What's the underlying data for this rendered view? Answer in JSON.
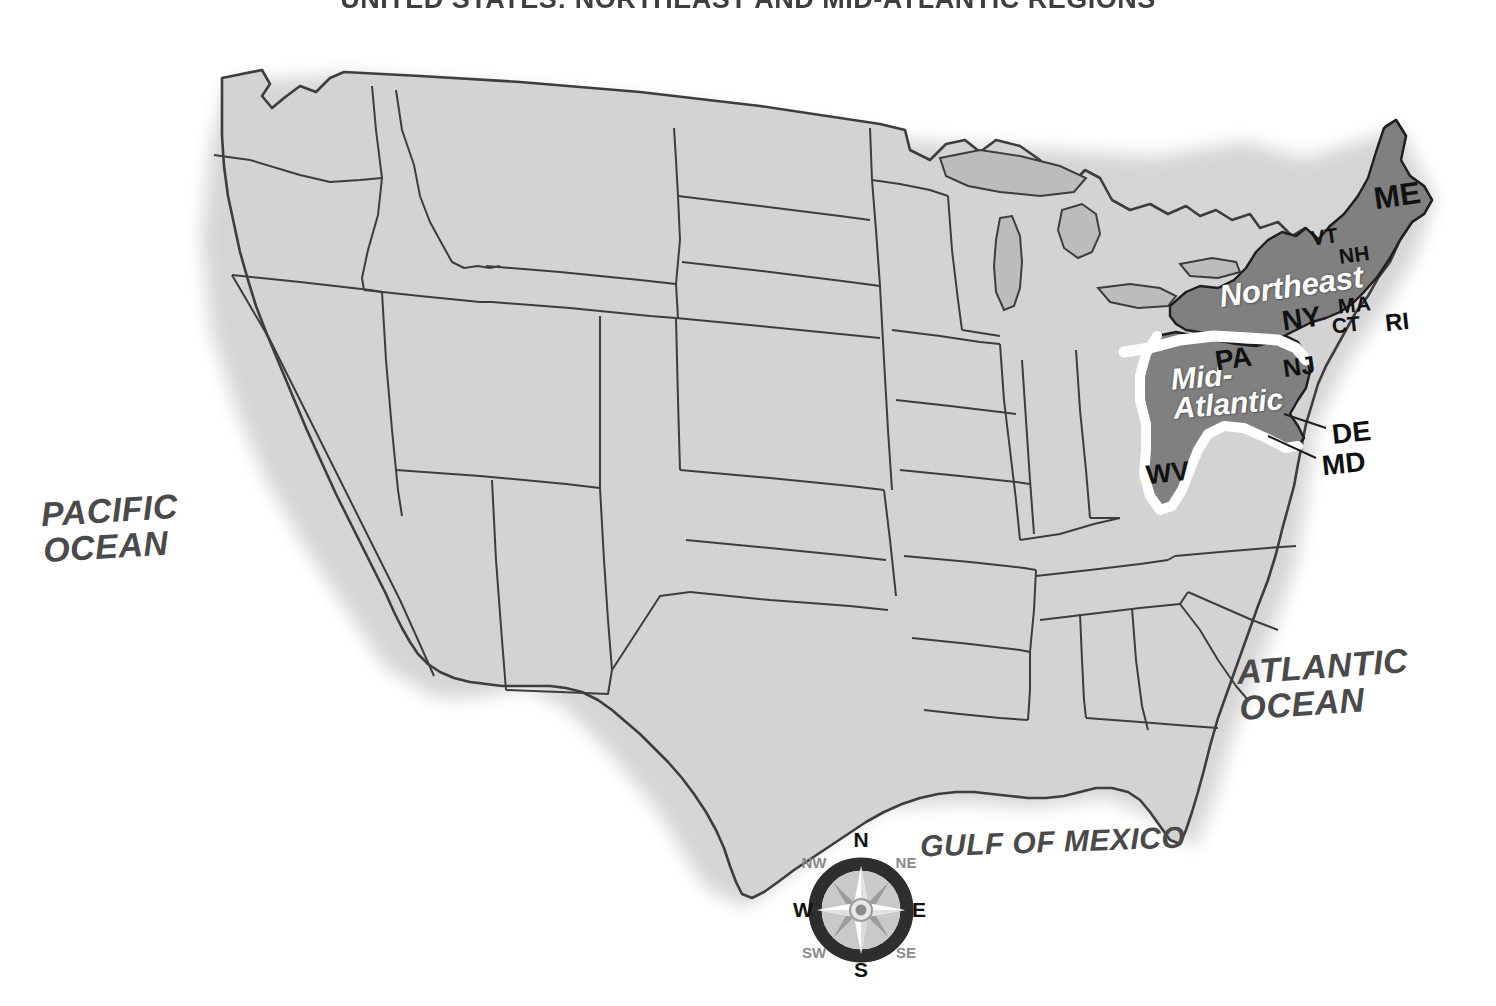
{
  "title": "UNITED STATES: NORTHEAST AND MID-ATLANTIC REGIONS",
  "oceans": {
    "pacific": "PACIFIC\nOCEAN",
    "atlantic": "ATLANTIC\nOCEAN",
    "gulf": "GULF OF MEXICO"
  },
  "regions": [
    {
      "id": "northeast",
      "label": "Northeast",
      "color": "#808080"
    },
    {
      "id": "mid-atlantic",
      "label": "Mid-\nAtlantic",
      "color": "#808080"
    }
  ],
  "state_labels": [
    {
      "code": "ME",
      "region": "northeast",
      "x": 1374,
      "y": 178,
      "size": 31,
      "rotate": -8
    },
    {
      "code": "VT",
      "region": "northeast",
      "x": 1311,
      "y": 225,
      "size": 21,
      "rotate": -8
    },
    {
      "code": "NH",
      "region": "northeast",
      "x": 1339,
      "y": 243,
      "size": 21,
      "rotate": -8
    },
    {
      "code": "NY",
      "region": "northeast",
      "x": 1282,
      "y": 303,
      "size": 28,
      "rotate": -8
    },
    {
      "code": "MA",
      "region": "northeast",
      "x": 1338,
      "y": 293,
      "size": 21,
      "rotate": -6
    },
    {
      "code": "CT",
      "region": "northeast",
      "x": 1332,
      "y": 313,
      "size": 21,
      "rotate": -6
    },
    {
      "code": "RI",
      "region": "northeast",
      "x": 1385,
      "y": 308,
      "size": 24,
      "rotate": -6
    },
    {
      "code": "PA",
      "region": "mid-atlantic",
      "x": 1215,
      "y": 343,
      "size": 28,
      "rotate": -8
    },
    {
      "code": "NJ",
      "region": "mid-atlantic",
      "x": 1283,
      "y": 352,
      "size": 25,
      "rotate": -8
    },
    {
      "code": "WV",
      "region": "mid-atlantic",
      "x": 1146,
      "y": 458,
      "size": 27,
      "rotate": -6
    },
    {
      "code": "DE",
      "region": "callout",
      "x": 1332,
      "y": 417,
      "size": 28,
      "rotate": -6
    },
    {
      "code": "MD",
      "region": "callout",
      "x": 1322,
      "y": 448,
      "size": 28,
      "rotate": -6
    }
  ],
  "region_labels": [
    {
      "id": "northeast",
      "text": "Northeast",
      "x": 1219,
      "y": 272,
      "size": 31,
      "rotate": -8
    },
    {
      "id": "mid-atlantic",
      "text": "Mid-\nAtlantic",
      "x": 1172,
      "y": 360,
      "size": 30,
      "rotate": -5
    }
  ],
  "compass": {
    "directions": {
      "n": "N",
      "ne": "NE",
      "e": "E",
      "se": "SE",
      "s": "S",
      "sw": "SW",
      "w": "W",
      "nw": "NW"
    }
  },
  "colors": {
    "background": "#ffffff",
    "land": "#d3d3d3",
    "land_stroke": "#3d3d3d",
    "lakes": "#bcbcbc",
    "highlight": "#808080",
    "highlight_stroke": "#1e1e1e",
    "region_divider": "#ffffff",
    "label_text": "#111111",
    "ocean_text": "#4a4a4a"
  }
}
